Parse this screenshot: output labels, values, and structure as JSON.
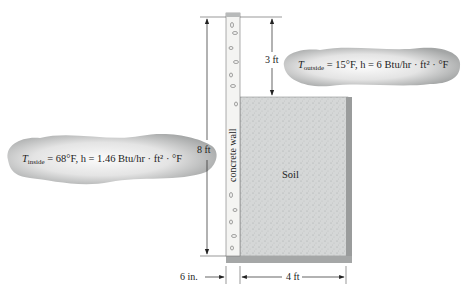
{
  "diagram": {
    "inside_label": {
      "T": "T",
      "sub": "inside",
      "rest": " = 68°F, h = 1.46 Btu/hr · ft² · °F"
    },
    "outside_label": {
      "T": "T",
      "sub": "outside",
      "rest": " = 15°F, h = 6 Btu/hr · ft² · °F"
    },
    "wall_label": "concrete wall",
    "soil_label": "Soil",
    "dim_height": "8 ft",
    "dim_above_soil": "3 ft",
    "dim_wall_thickness": "6 in.",
    "dim_soil_width": "4 ft"
  },
  "colors": {
    "soil": "#d6d8d8",
    "soil_edge": "#9a9c9c",
    "wall": "#f4f4f2",
    "wall_cap": "#b8baba",
    "cloud_dark": "#a6a8a8",
    "cloud_light": "#f2f2f2"
  }
}
